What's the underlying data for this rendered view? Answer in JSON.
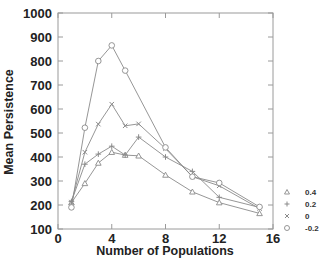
{
  "chart_data": {
    "type": "line",
    "title": "",
    "xlabel": "Number of Populations",
    "ylabel": "Mean Persistence",
    "xlim": [
      0,
      16
    ],
    "ylim": [
      100,
      1000
    ],
    "xticks": [
      0,
      4,
      8,
      12,
      16
    ],
    "yticks": [
      100,
      200,
      300,
      400,
      500,
      600,
      700,
      800,
      900,
      1000
    ],
    "grid": false,
    "legend_position": "right-bottom",
    "series": [
      {
        "name": "0.4",
        "marker": "triangle",
        "x": [
          1,
          2,
          3,
          4,
          5,
          6,
          8,
          10,
          12,
          15
        ],
        "values": [
          210,
          290,
          375,
          420,
          408,
          405,
          325,
          255,
          210,
          165
        ]
      },
      {
        "name": "0.2",
        "marker": "plus",
        "x": [
          1,
          2,
          3,
          4,
          5,
          6,
          8,
          10,
          12,
          15
        ],
        "values": [
          215,
          370,
          412,
          445,
          408,
          483,
          400,
          340,
          232,
          190
        ]
      },
      {
        "name": "0",
        "marker": "cross",
        "x": [
          1,
          2,
          3,
          4,
          5,
          6,
          8,
          10,
          12,
          15
        ],
        "values": [
          212,
          420,
          537,
          620,
          530,
          538,
          435,
          318,
          280,
          185
        ]
      },
      {
        "name": "-0.2",
        "marker": "circle",
        "x": [
          1,
          2,
          3,
          4,
          5,
          8,
          10,
          12,
          15
        ],
        "values": [
          190,
          522,
          800,
          865,
          760,
          440,
          318,
          292,
          192
        ]
      }
    ]
  },
  "axes": {
    "x_title": "Number of Populations",
    "y_title": "Mean Persistence",
    "x_tick_labels": [
      "0",
      "4",
      "8",
      "12",
      "16"
    ],
    "y_tick_labels": [
      "100",
      "200",
      "300",
      "400",
      "500",
      "600",
      "700",
      "800",
      "900",
      "1000"
    ]
  },
  "legend": [
    {
      "label": "0.4",
      "marker": "triangle"
    },
    {
      "label": "0.2",
      "marker": "plus"
    },
    {
      "label": "0",
      "marker": "cross"
    },
    {
      "label": "-0.2",
      "marker": "circle"
    }
  ],
  "colors": {
    "line": "#8a8a8a",
    "axis": "#9a9a9a",
    "text": "#222222"
  }
}
